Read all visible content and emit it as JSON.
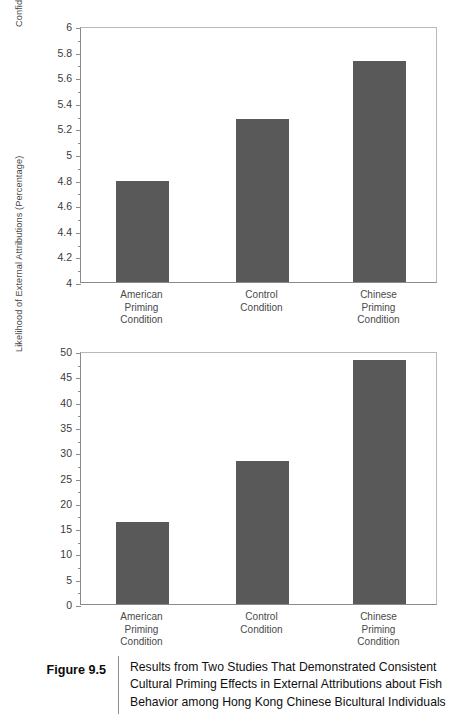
{
  "figure": {
    "tag": "Figure 9.5",
    "caption": "Results from Two Studies That Demonstrated Consistent Cultural Priming Effects in External Attributions about Fish Behavior among Hong Kong Chinese Bicultural Individuals"
  },
  "colors": {
    "bar": "#595959",
    "axis": "#8b8b8b",
    "frame": "#b9b9b9",
    "text": "#3b3b3b",
    "caption_text": "#0f0f0f"
  },
  "chart_data": [
    {
      "type": "bar",
      "title": "",
      "xlabel": "",
      "ylabel": "Confidence in External Attributions",
      "categories": [
        "American\nPriming\nCondition",
        "Control\nCondition",
        "Chinese\nPriming\nCondition"
      ],
      "values": [
        4.79,
        5.27,
        5.73
      ],
      "ylim": [
        4,
        6
      ],
      "ytick_step": 0.2,
      "yticks": [
        4,
        4.2,
        4.4,
        4.6,
        4.8,
        5,
        5.2,
        5.4,
        5.6,
        5.8,
        6
      ],
      "ytick_labels": [
        "4",
        "4.2",
        "4.4",
        "4.6",
        "4.8",
        "5",
        "5.2",
        "5.4",
        "5.6",
        "5.8",
        "6"
      ],
      "grid": false,
      "legend": null
    },
    {
      "type": "bar",
      "title": "",
      "xlabel": "",
      "ylabel": "Likelihood of External Attributions (Percentage)",
      "categories": [
        "American\nPriming\nCondition",
        "Control\nCondition",
        "Chinese\nPriming\nCondition"
      ],
      "values": [
        16.3,
        28.2,
        48.2
      ],
      "ylim": [
        0,
        50
      ],
      "ytick_step": 5,
      "yticks": [
        0,
        5,
        10,
        15,
        20,
        25,
        30,
        35,
        40,
        45,
        50
      ],
      "ytick_labels": [
        "0",
        "5",
        "10",
        "15",
        "20",
        "25",
        "30",
        "35",
        "40",
        "45",
        "50"
      ],
      "grid": false,
      "legend": null
    }
  ]
}
